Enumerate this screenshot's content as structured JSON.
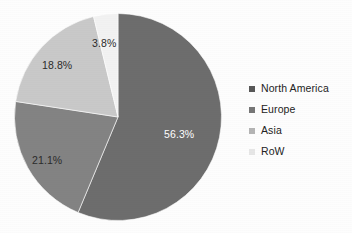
{
  "chart_data": {
    "type": "pie",
    "title": "",
    "xlabel": "",
    "ylabel": "",
    "categories": [
      "North America",
      "Europe",
      "Asia",
      "RoW"
    ],
    "values": [
      56.3,
      21.1,
      18.8,
      3.8
    ],
    "value_labels": [
      "56.3%",
      "21.1%",
      "18.8%",
      "3.8%"
    ],
    "units": "percent",
    "total": 100.0,
    "start_angle_deg": 0,
    "direction": "clockwise",
    "grid": false,
    "legend_position": "right",
    "colors": [
      "#6d6d6d",
      "#838383",
      "#c9c9c9",
      "#f2f2f2"
    ],
    "slices": [
      {
        "label": "North America",
        "value": 56.3,
        "value_label": "56.3%",
        "color": "#6d6d6d",
        "label_color": "#ffffff"
      },
      {
        "label": "Europe",
        "value": 21.1,
        "value_label": "21.1%",
        "color": "#838383",
        "label_color": "#2b2b2b"
      },
      {
        "label": "Asia",
        "value": 18.8,
        "value_label": "18.8%",
        "color": "#c9c9c9",
        "label_color": "#2b2b2b"
      },
      {
        "label": "RoW",
        "value": 3.8,
        "value_label": "3.8%",
        "color": "#f2f2f2",
        "label_color": "#2b2b2b"
      }
    ]
  },
  "legend": {
    "items": [
      {
        "label": "North America",
        "color": "#575757"
      },
      {
        "label": "Europe",
        "color": "#767676"
      },
      {
        "label": "Asia",
        "color": "#b4b4b4"
      },
      {
        "label": "RoW",
        "color": "#e6e6e6"
      }
    ]
  }
}
